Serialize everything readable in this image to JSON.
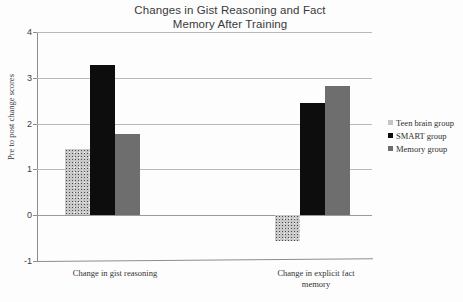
{
  "chart_data": {
    "type": "bar",
    "title": "Changes in Gist Reasoning and Fact Memory After Training",
    "title_line1": "Changes in Gist Reasoning and Fact",
    "title_line2": "Memory After Training",
    "xlabel": "",
    "ylabel": "Pre to post change scores",
    "ylim": [
      -1,
      4
    ],
    "yticks": [
      4,
      3,
      2,
      1,
      0,
      -1
    ],
    "ytick_labels": [
      "4",
      "3",
      "2",
      "1",
      "0",
      "-1"
    ],
    "grid": true,
    "legend_position": "right",
    "categories": [
      "Change in gist reasoning",
      "Change in explicit fact memory"
    ],
    "category_labels": [
      {
        "line1": "Change in gist reasoning",
        "line2": ""
      },
      {
        "line1": "Change in explicit fact",
        "line2": "memory"
      }
    ],
    "series": [
      {
        "name": "Teen brain group",
        "color": "#c9c9c9",
        "pattern": "speckled",
        "values": [
          1.45,
          -0.57
        ]
      },
      {
        "name": "SMART group",
        "color": "#0d0d0d",
        "pattern": "solid",
        "values": [
          3.28,
          2.45
        ]
      },
      {
        "name": "Memory group",
        "color": "#6e6e6e",
        "pattern": "solid",
        "values": [
          1.78,
          2.83
        ]
      }
    ],
    "legend_entries": [
      {
        "label": "Teen brain group",
        "color": "#c9c9c9"
      },
      {
        "label": "SMART group",
        "color": "#0d0d0d"
      },
      {
        "label": "Memory group",
        "color": "#6e6e6e"
      }
    ]
  }
}
